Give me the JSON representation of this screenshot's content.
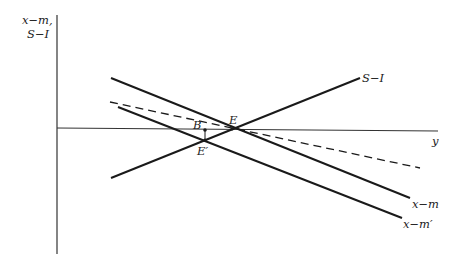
{
  "diagram": {
    "axes": {
      "y_label_line1": "x−m,",
      "y_label_line2": "S−I",
      "x_label": "y"
    },
    "curves": {
      "s_minus_i": "S−I",
      "x_minus_m": "x−m",
      "x_minus_m_prime": "x−m′"
    },
    "points": {
      "E": "E",
      "E_prime": "E′",
      "B": "B"
    },
    "colors": {
      "ink": "#1a1a1a",
      "axis": "#333333",
      "background": "#ffffff"
    }
  }
}
